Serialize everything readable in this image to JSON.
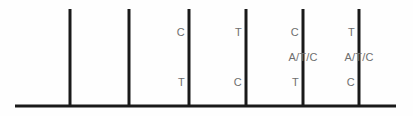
{
  "figure": {
    "background_color": "#fefefe",
    "line_color": "#1a1a1a",
    "text_color": "#6e6e6e",
    "axis": {
      "name": "baseline",
      "x_start": 15,
      "x_end": 396,
      "y": 106,
      "thickness": 3
    },
    "ticks": [
      {
        "id": "tick-1",
        "x": 70,
        "y_top": 9,
        "y_bottom": 106,
        "thickness": 3,
        "top_label": "",
        "mid_label": "",
        "bottom_label": ""
      },
      {
        "id": "tick-2",
        "x": 129,
        "y_top": 9,
        "y_bottom": 106,
        "thickness": 3,
        "top_label": "",
        "mid_label": "",
        "bottom_label": ""
      },
      {
        "id": "tick-3",
        "x": 189,
        "y_top": 9,
        "y_bottom": 106,
        "thickness": 3,
        "top_label": "C",
        "mid_label": "",
        "bottom_label": "T"
      },
      {
        "id": "tick-4",
        "x": 246,
        "y_top": 9,
        "y_bottom": 106,
        "thickness": 3,
        "top_label": "T",
        "mid_label": "",
        "bottom_label": "C"
      },
      {
        "id": "tick-5",
        "x": 303,
        "y_top": 9,
        "y_bottom": 106,
        "thickness": 3,
        "top_label": "C",
        "mid_label": "A/T/C",
        "bottom_label": "T"
      },
      {
        "id": "tick-6",
        "x": 359,
        "y_top": 9,
        "y_bottom": 106,
        "thickness": 3,
        "top_label": "T",
        "mid_label": "A/T/C",
        "bottom_label": "C"
      }
    ],
    "label_rows": {
      "top_y": 27,
      "mid_y": 52,
      "bottom_y": 77
    }
  },
  "chart_data": {
    "type": "diagram",
    "title": "",
    "xlabel": "",
    "ylabel": "",
    "positions": [
      1,
      2,
      3,
      4,
      5,
      6
    ],
    "series": [
      {
        "name": "top allele",
        "values": [
          "",
          "",
          "C",
          "T",
          "C",
          "T"
        ]
      },
      {
        "name": "middle allele",
        "values": [
          "",
          "",
          "",
          "",
          "A/T/C",
          "A/T/C"
        ]
      },
      {
        "name": "bottom allele",
        "values": [
          "",
          "",
          "T",
          "C",
          "T",
          "C"
        ]
      }
    ]
  }
}
